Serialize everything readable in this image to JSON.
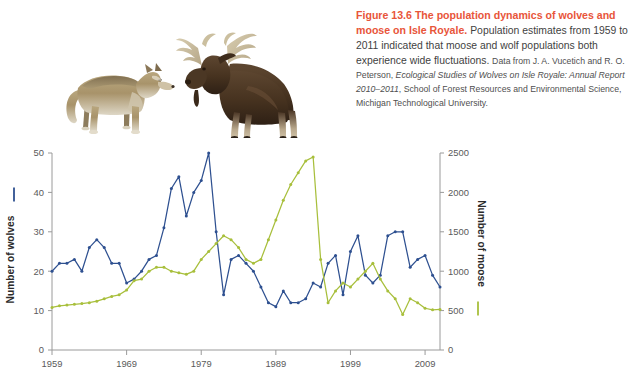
{
  "figure": {
    "caption_lead": "Figure 13.6  The population dynamics of wolves and moose on Isle Royale.",
    "caption_body": " Population estimates from 1959 to 2011 indicated that moose and wolf populations both experience wide fluctuations.",
    "source_prefix": "Data from J. A. Vucetich and R. O. Peterson, ",
    "source_italic": "Ecological Studies of Wolves on Isle Royale: Annual Report 2010–2011",
    "source_suffix": ", School of Forest Resources and Environmental Science, Michigan Technological University.",
    "lead_color": "#e8553a"
  },
  "illustration": {
    "wolf_label": "wolf-illustration",
    "moose_label": "moose-illustration"
  },
  "chart_data": {
    "type": "line",
    "title": "",
    "xlabel": "",
    "grid": false,
    "legend_position": "axis-titles",
    "x": [
      1959,
      1960,
      1961,
      1962,
      1963,
      1964,
      1965,
      1966,
      1967,
      1968,
      1969,
      1970,
      1971,
      1972,
      1973,
      1974,
      1975,
      1976,
      1977,
      1978,
      1979,
      1980,
      1981,
      1982,
      1983,
      1984,
      1985,
      1986,
      1987,
      1988,
      1989,
      1990,
      1991,
      1992,
      1993,
      1994,
      1995,
      1996,
      1997,
      1998,
      1999,
      2000,
      2001,
      2002,
      2003,
      2004,
      2005,
      2006,
      2007,
      2008,
      2009,
      2010,
      2011
    ],
    "xlim": [
      1959,
      2011
    ],
    "xticks": [
      1959,
      1969,
      1979,
      1989,
      1999,
      2009
    ],
    "xticklabels": [
      "1959",
      "1969",
      "1979",
      "1989",
      "1999",
      "2009"
    ],
    "series": [
      {
        "name": "Number of wolves",
        "axis": "left",
        "color": "#2e5090",
        "ylabel": "Number of wolves",
        "ylim": [
          0,
          50
        ],
        "yticks": [
          0,
          10,
          20,
          30,
          40,
          50
        ],
        "yticklabels": [
          "0",
          "10",
          "20",
          "30",
          "40",
          "50"
        ],
        "values": [
          20,
          22,
          22,
          23,
          20,
          26,
          28,
          26,
          22,
          22,
          17,
          18,
          20,
          23,
          24,
          31,
          41,
          44,
          34,
          40,
          43,
          50,
          30,
          14,
          23,
          24,
          22,
          20,
          16,
          12,
          11,
          15,
          12,
          12,
          13,
          17,
          16,
          22,
          24,
          14,
          25,
          29,
          19,
          17,
          19,
          29,
          30,
          30,
          21,
          23,
          24,
          19,
          16
        ]
      },
      {
        "name": "Number of moose",
        "axis": "right",
        "color": "#a8bf3c",
        "ylabel": "Number of moose",
        "ylim": [
          0,
          2500
        ],
        "yticks": [
          0,
          500,
          1000,
          1500,
          2000,
          2500
        ],
        "yticklabels": [
          "0",
          "500",
          "1000",
          "1500",
          "2000",
          "2500"
        ],
        "values": [
          540,
          560,
          570,
          580,
          590,
          600,
          620,
          650,
          680,
          700,
          760,
          880,
          900,
          1000,
          1050,
          1050,
          1000,
          980,
          960,
          1000,
          1150,
          1250,
          1350,
          1450,
          1400,
          1300,
          1150,
          1100,
          1150,
          1400,
          1650,
          1900,
          2100,
          2250,
          2400,
          2450,
          1150,
          600,
          750,
          850,
          800,
          900,
          1000,
          1100,
          900,
          750,
          650,
          450,
          650,
          600,
          530,
          510,
          515
        ]
      }
    ]
  }
}
